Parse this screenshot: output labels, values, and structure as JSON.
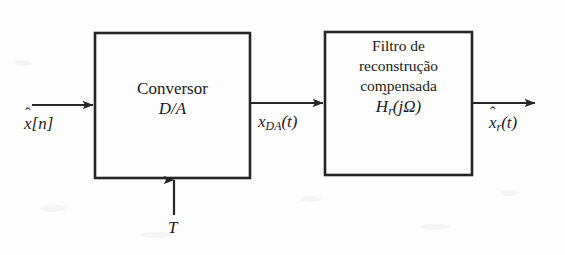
{
  "diagram": {
    "line_color": "#262626",
    "background_color": "#fdfdfd",
    "blocks": [
      {
        "id": "da-converter",
        "line1": "Conversor",
        "line2": "D/A",
        "x": 95,
        "y": 33,
        "width": 155,
        "height": 145
      },
      {
        "id": "reconstruction-filter",
        "line1": "Filtro de",
        "line2": "reconstrução",
        "line3": "compensada",
        "formula_base": "H",
        "formula_accent": "̃",
        "formula_sub": "r",
        "formula_arg": "(jΩ)",
        "x": 325,
        "y": 32,
        "width": 147,
        "height": 143
      }
    ],
    "signals": {
      "input": {
        "base": "x",
        "accent": "̂",
        "arg": "[n]",
        "full": "x̂[n]"
      },
      "intermediate": {
        "base": "x",
        "sub": "DA",
        "arg": "(t)",
        "full": "x_DA(t)"
      },
      "clock": {
        "full": "T"
      },
      "output": {
        "base": "x",
        "accent": "̂",
        "sub": "r",
        "arg": "(t)",
        "full": "x̂_r(t)"
      }
    },
    "arrows": [
      {
        "id": "input-arrow",
        "from": [
          32,
          105
        ],
        "to": [
          95,
          105
        ],
        "direction": "right"
      },
      {
        "id": "middle-arrow",
        "from": [
          250,
          103
        ],
        "to": [
          325,
          103
        ],
        "direction": "right"
      },
      {
        "id": "output-arrow",
        "from": [
          472,
          103
        ],
        "to": [
          537,
          103
        ],
        "direction": "right"
      },
      {
        "id": "clock-arrow",
        "from": [
          174,
          215
        ],
        "to": [
          174,
          178
        ],
        "direction": "up"
      }
    ]
  }
}
